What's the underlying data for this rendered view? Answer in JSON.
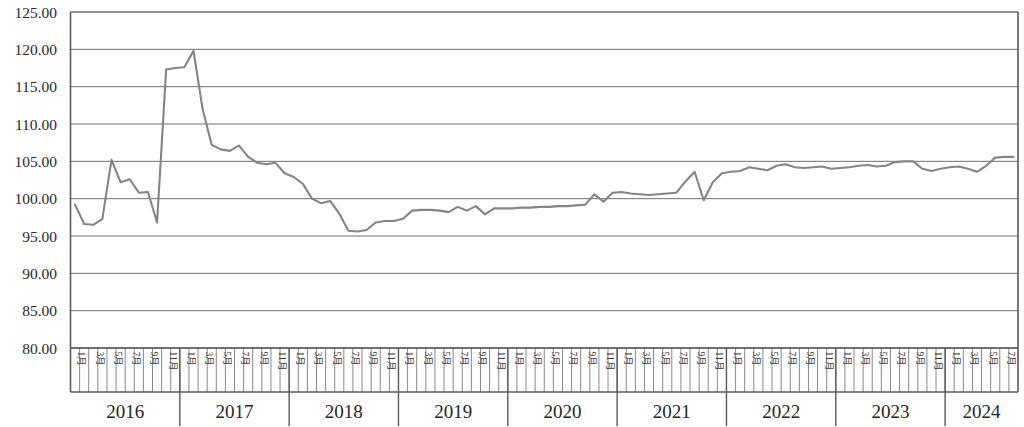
{
  "chart_data": {
    "type": "line",
    "title": "",
    "subtitle": "",
    "xlabel": "",
    "ylabel": "",
    "ylim": [
      80.0,
      125.0
    ],
    "y_ticks": [
      "125.00",
      "120.00",
      "115.00",
      "110.00",
      "105.00",
      "100.00",
      "95.00",
      "90.00",
      "85.00",
      "80.00"
    ],
    "y_tick_values": [
      125,
      120,
      115,
      110,
      105,
      100,
      95,
      90,
      85,
      80
    ],
    "grid": true,
    "legend": "none",
    "line_color": "#858585",
    "axis_color": "#5a5a5a",
    "grid_color": "#6f6f6f",
    "month_tick_label_template": "月",
    "month_tick_numbers": [
      1,
      3,
      5,
      7,
      9,
      11
    ],
    "month_tick_labels": [
      "1月",
      "3月",
      "5月",
      "7月",
      "9月",
      "11月"
    ],
    "year_groups": [
      {
        "year": "2016",
        "months": 12,
        "labeled_months": [
          "1月",
          "3月",
          "5月",
          "7月",
          "9月",
          "11月"
        ]
      },
      {
        "year": "2017",
        "months": 12,
        "labeled_months": [
          "1月",
          "3月",
          "5月",
          "7月",
          "9月",
          "11月"
        ]
      },
      {
        "year": "2018",
        "months": 12,
        "labeled_months": [
          "1月",
          "3月",
          "5月",
          "7月",
          "9月",
          "11月"
        ]
      },
      {
        "year": "2019",
        "months": 12,
        "labeled_months": [
          "1月",
          "3月",
          "5月",
          "7月",
          "9月",
          "11月"
        ]
      },
      {
        "year": "2020",
        "months": 12,
        "labeled_months": [
          "1月",
          "3月",
          "5月",
          "7月",
          "9月",
          "11月"
        ]
      },
      {
        "year": "2021",
        "months": 12,
        "labeled_months": [
          "1月",
          "3月",
          "5月",
          "7月",
          "9月",
          "11月"
        ]
      },
      {
        "year": "2022",
        "months": 12,
        "labeled_months": [
          "1月",
          "3月",
          "5月",
          "7月",
          "9月",
          "11月"
        ]
      },
      {
        "year": "2023",
        "months": 12,
        "labeled_months": [
          "1月",
          "3月",
          "5月",
          "7月",
          "9月",
          "11月"
        ]
      },
      {
        "year": "2024",
        "months": 8,
        "labeled_months": [
          "1月",
          "3月",
          "5月",
          "7月"
        ]
      }
    ],
    "x": [
      "2016-01",
      "2016-02",
      "2016-03",
      "2016-04",
      "2016-05",
      "2016-06",
      "2016-07",
      "2016-08",
      "2016-09",
      "2016-10",
      "2016-11",
      "2016-12",
      "2017-01",
      "2017-02",
      "2017-03",
      "2017-04",
      "2017-05",
      "2017-06",
      "2017-07",
      "2017-08",
      "2017-09",
      "2017-10",
      "2017-11",
      "2017-12",
      "2018-01",
      "2018-02",
      "2018-03",
      "2018-04",
      "2018-05",
      "2018-06",
      "2018-07",
      "2018-08",
      "2018-09",
      "2018-10",
      "2018-11",
      "2018-12",
      "2019-01",
      "2019-02",
      "2019-03",
      "2019-04",
      "2019-05",
      "2019-06",
      "2019-07",
      "2019-08",
      "2019-09",
      "2019-10",
      "2019-11",
      "2019-12",
      "2020-01",
      "2020-02",
      "2020-03",
      "2020-04",
      "2020-05",
      "2020-06",
      "2020-07",
      "2020-08",
      "2020-09",
      "2020-10",
      "2020-11",
      "2020-12",
      "2021-01",
      "2021-02",
      "2021-03",
      "2021-04",
      "2021-05",
      "2021-06",
      "2021-07",
      "2021-08",
      "2021-09",
      "2021-10",
      "2021-11",
      "2021-12",
      "2022-01",
      "2022-02",
      "2022-03",
      "2022-04",
      "2022-05",
      "2022-06",
      "2022-07",
      "2022-08",
      "2022-09",
      "2022-10",
      "2022-11",
      "2022-12",
      "2023-01",
      "2023-02",
      "2023-03",
      "2023-04",
      "2023-05",
      "2023-06",
      "2023-07",
      "2023-08",
      "2023-09",
      "2023-10",
      "2023-11",
      "2023-12",
      "2024-01",
      "2024-02",
      "2024-03",
      "2024-04",
      "2024-05",
      "2024-06",
      "2024-07",
      "2024-08"
    ],
    "values": [
      99.2,
      96.6,
      96.5,
      97.3,
      105.2,
      102.2,
      102.6,
      100.8,
      100.9,
      96.8,
      117.3,
      117.5,
      117.6,
      119.8,
      112.0,
      107.2,
      106.6,
      106.4,
      107.1,
      105.6,
      104.8,
      104.6,
      104.8,
      103.4,
      102.9,
      102.0,
      100.0,
      99.4,
      99.7,
      98.0,
      95.7,
      95.6,
      95.8,
      96.8,
      97.0,
      97.0,
      97.3,
      98.4,
      98.5,
      98.5,
      98.4,
      98.2,
      98.9,
      98.4,
      99.0,
      97.9,
      98.7,
      98.7,
      98.7,
      98.8,
      98.8,
      98.9,
      98.9,
      99.0,
      99.0,
      99.1,
      99.2,
      100.6,
      99.6,
      100.8,
      100.9,
      100.7,
      100.6,
      100.5,
      100.6,
      100.7,
      100.8,
      102.3,
      103.6,
      99.8,
      102.2,
      103.4,
      103.6,
      103.7,
      104.2,
      104.0,
      103.8,
      104.4,
      104.6,
      104.2,
      104.1,
      104.2,
      104.3,
      104.0,
      104.1,
      104.2,
      104.4,
      104.5,
      104.3,
      104.4,
      104.9,
      105.0,
      105.0,
      104.0,
      103.7,
      104.0,
      104.2,
      104.3,
      104.0,
      103.6,
      104.4,
      105.5,
      105.6,
      105.6
    ]
  }
}
